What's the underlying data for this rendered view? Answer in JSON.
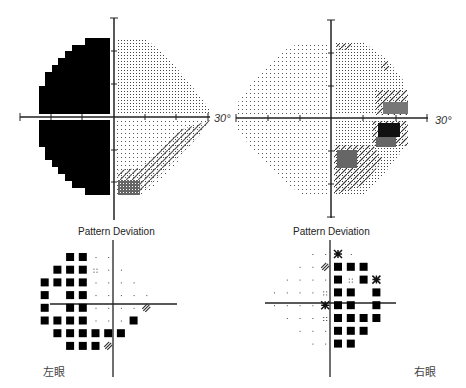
{
  "left_eye": {
    "label": "左眼",
    "grayscale": {
      "axis_label": "30°",
      "description": "Left hemifield fully black (dense loss); right hemifield light dotted with inferior-nasal hatched/dark defect"
    },
    "pattern_deviation": {
      "title": "Pattern Deviation",
      "rows": [
        [
          "",
          "",
          "",
          "B",
          "B",
          "d",
          "d",
          "",
          "",
          ""
        ],
        [
          "",
          "",
          "B",
          "B",
          "B",
          "dd",
          "d",
          "d",
          "",
          ""
        ],
        [
          "",
          "B",
          "B",
          "B",
          "B",
          "d",
          "d",
          "d",
          "d",
          ""
        ],
        [
          "",
          "B",
          "",
          "B",
          "B",
          "d",
          "d",
          "d",
          "d",
          "d"
        ],
        [
          "",
          "B",
          "",
          "B",
          "B",
          "d",
          "d",
          "d",
          "d",
          "h"
        ],
        [
          "",
          "B",
          "B",
          "B",
          "B",
          "d",
          "d",
          "d",
          "B",
          ""
        ],
        [
          "",
          "",
          "B",
          "B",
          "B",
          "B",
          "B",
          "B",
          "",
          ""
        ],
        [
          "",
          "",
          "",
          "B",
          "B",
          "B",
          "h",
          "",
          "",
          ""
        ]
      ]
    }
  },
  "right_eye": {
    "label": "右眼",
    "grayscale": {
      "axis_label": "30°",
      "description": "Mostly light dotted field with nasal (right) dark step defects and inferior hatched region"
    },
    "pattern_deviation": {
      "title": "Pattern Deviation",
      "rows": [
        [
          "",
          "",
          "",
          "d",
          "d",
          "x",
          "d",
          "",
          "",
          ""
        ],
        [
          "",
          "",
          "d",
          "d",
          "h",
          "B",
          "B",
          "B",
          "",
          ""
        ],
        [
          "",
          "d",
          "d",
          "d",
          "d",
          "B",
          "dd",
          "B",
          "x",
          ""
        ],
        [
          "d",
          "d",
          "d",
          "d",
          "dd",
          "B",
          "B",
          "",
          "B",
          ""
        ],
        [
          "d",
          "d",
          "d",
          "d",
          "x",
          "B",
          "B",
          "",
          "B",
          ""
        ],
        [
          "",
          "d",
          "d",
          "d",
          "dd",
          "B",
          "B",
          "B",
          "B",
          ""
        ],
        [
          "",
          "",
          "d",
          "d",
          "d",
          "B",
          "B",
          "B",
          "",
          ""
        ],
        [
          "",
          "",
          "",
          "d",
          "d",
          "B",
          "B",
          "",
          "",
          ""
        ]
      ]
    }
  },
  "legend": {
    "B": "black square",
    "d": "single dot",
    "dd": "double dots",
    "h": "hatched symbol",
    "x": "dense checker symbol"
  }
}
